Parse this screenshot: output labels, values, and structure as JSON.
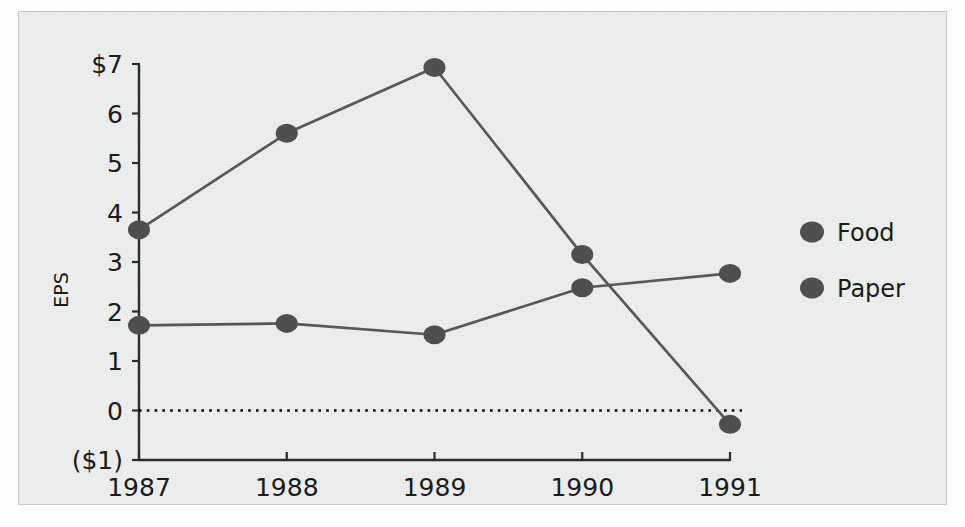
{
  "chart_data": {
    "type": "line",
    "title": "",
    "subtitle": "",
    "xlabel": "",
    "ylabel": "EPS",
    "categories": [
      "1987",
      "1988",
      "1989",
      "1990",
      "1991"
    ],
    "x_tick_labels": [
      "1987",
      "1988",
      "1989",
      "1990",
      "1991"
    ],
    "y_tick_labels": [
      "$7",
      "6",
      "5",
      "4",
      "3",
      "2",
      "1",
      "0",
      "($1)"
    ],
    "y_tick_values": [
      7,
      6,
      5,
      4,
      3,
      2,
      1,
      0,
      -1
    ],
    "ylim": [
      -1,
      7
    ],
    "grid": false,
    "zero_line": true,
    "legend_position": "right",
    "series": [
      {
        "name": "Food",
        "color": "#585858",
        "values": [
          3.65,
          5.6,
          6.93,
          3.15,
          -0.28
        ]
      },
      {
        "name": "Paper",
        "color": "#585858",
        "values": [
          1.72,
          1.76,
          1.53,
          2.48,
          2.77
        ]
      }
    ]
  },
  "legend": {
    "items": [
      {
        "label": "Food",
        "marker": "filled-circle-marker"
      },
      {
        "label": "Paper",
        "marker": "filled-circle-marker"
      }
    ]
  },
  "axes": {
    "y_axis_title": "EPS"
  },
  "colors": {
    "plate_background": "#eceded",
    "plate_border": "#c9cbcb",
    "axis": "#2b2b2b",
    "series": "#585858",
    "marker": "#4f4f4f",
    "text": "#1b1b1b",
    "zero_line": "#000000"
  }
}
